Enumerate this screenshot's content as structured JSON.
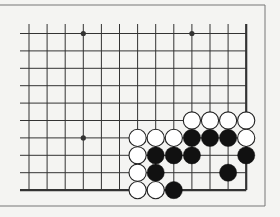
{
  "diagram": {
    "type": "go-board-fragment",
    "colors": {
      "background": "#f4f4f2",
      "line": "#333333",
      "black_stone": "#111111",
      "white_stone": "#ffffff",
      "frame": "#777777"
    },
    "grid": {
      "columns": 13,
      "rows": 10,
      "x0": 29,
      "dx": 18.1,
      "y0": 33.5,
      "dy": 17.4,
      "right_edge_is_board_edge": true,
      "bottom_edge_is_board_edge": true
    },
    "star_points": [
      {
        "col": 3,
        "row": 0
      },
      {
        "col": 9,
        "row": 0
      },
      {
        "col": 3,
        "row": 6
      }
    ],
    "stones": [
      {
        "color": "white",
        "col": 9,
        "row": 5
      },
      {
        "color": "white",
        "col": 10,
        "row": 5
      },
      {
        "color": "white",
        "col": 11,
        "row": 5
      },
      {
        "color": "white",
        "col": 12,
        "row": 5
      },
      {
        "color": "white",
        "col": 6,
        "row": 6
      },
      {
        "color": "white",
        "col": 7,
        "row": 6
      },
      {
        "color": "white",
        "col": 8,
        "row": 6
      },
      {
        "color": "black",
        "col": 9,
        "row": 6
      },
      {
        "color": "black",
        "col": 10,
        "row": 6
      },
      {
        "color": "black",
        "col": 11,
        "row": 6
      },
      {
        "color": "white",
        "col": 12,
        "row": 6
      },
      {
        "color": "white",
        "col": 6,
        "row": 7
      },
      {
        "color": "black",
        "col": 7,
        "row": 7
      },
      {
        "color": "black",
        "col": 8,
        "row": 7
      },
      {
        "color": "black",
        "col": 9,
        "row": 7
      },
      {
        "color": "black",
        "col": 12,
        "row": 7
      },
      {
        "color": "white",
        "col": 6,
        "row": 8
      },
      {
        "color": "black",
        "col": 7,
        "row": 8
      },
      {
        "color": "black",
        "col": 11,
        "row": 8
      },
      {
        "color": "white",
        "col": 6,
        "row": 9
      },
      {
        "color": "white",
        "col": 7,
        "row": 9
      },
      {
        "color": "black",
        "col": 8,
        "row": 9
      }
    ]
  }
}
